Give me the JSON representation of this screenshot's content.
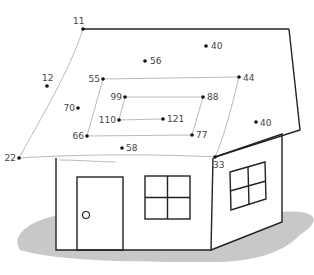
{
  "colors": {
    "line": "#222222",
    "guide": "#bbbbbb",
    "shadow": "#c8c8c8",
    "dot": "#111111",
    "label": "#444444",
    "background": "#ffffff"
  },
  "dots": [
    {
      "label": "11",
      "x": 83,
      "y": 29,
      "lx": 73,
      "ly": 24,
      "anchor": "start"
    },
    {
      "label": "56",
      "x": 145,
      "y": 61,
      "lx": 150,
      "ly": 64,
      "anchor": "start"
    },
    {
      "label": "40",
      "x": 206,
      "y": 46,
      "lx": 211,
      "ly": 49,
      "anchor": "start"
    },
    {
      "label": "12",
      "x": 47,
      "y": 86,
      "lx": 42,
      "ly": 81,
      "anchor": "start"
    },
    {
      "label": "55",
      "x": 103,
      "y": 79,
      "lx": 100,
      "ly": 82,
      "anchor": "end"
    },
    {
      "label": "44",
      "x": 239,
      "y": 77,
      "lx": 243,
      "ly": 81,
      "anchor": "start"
    },
    {
      "label": "70",
      "x": 78,
      "y": 108,
      "lx": 75,
      "ly": 111,
      "anchor": "end"
    },
    {
      "label": "99",
      "x": 125,
      "y": 97,
      "lx": 122,
      "ly": 100,
      "anchor": "end"
    },
    {
      "label": "88",
      "x": 203,
      "y": 97,
      "lx": 207,
      "ly": 100,
      "anchor": "start"
    },
    {
      "label": "110",
      "x": 119,
      "y": 120,
      "lx": 116,
      "ly": 123,
      "anchor": "end"
    },
    {
      "label": "121",
      "x": 163,
      "y": 119,
      "lx": 167,
      "ly": 122,
      "anchor": "start"
    },
    {
      "label": "40",
      "x": 256,
      "y": 122,
      "lx": 260,
      "ly": 126,
      "anchor": "start"
    },
    {
      "label": "66",
      "x": 87,
      "y": 136,
      "lx": 84,
      "ly": 139,
      "anchor": "end"
    },
    {
      "label": "77",
      "x": 192,
      "y": 135,
      "lx": 196,
      "ly": 138,
      "anchor": "start"
    },
    {
      "label": "22",
      "x": 19,
      "y": 158,
      "lx": 16,
      "ly": 161,
      "anchor": "end"
    },
    {
      "label": "58",
      "x": 122,
      "y": 148,
      "lx": 126,
      "ly": 151,
      "anchor": "start"
    },
    {
      "label": "33",
      "x": 215,
      "y": 157,
      "lx": 213,
      "ly": 168,
      "anchor": "start"
    }
  ],
  "guides": {
    "outer_roof_left": "M83,29 C70,70 40,120 19,158",
    "outer_roof_bottom": "M19,158 C80,154 160,154 215,157",
    "outer_roof_right": "M239,77 C232,105 225,135 215,157",
    "spiral_1": "M103,79 L239,77",
    "spiral_2": "M103,79 L87,136 L192,135 L203,97 L125,97 L119,120 L163,119",
    "stray_stroke": "M60,160 C80,160 100,162 115,162"
  },
  "house": {
    "roof_top": "M83,29 L289,29",
    "gable": "M289,29 L300,130 L215,157",
    "side_wall": "M215,157 L282,134 L282,222 L211,250",
    "front_wall": "M56,158 L56,250 L211,250 L213,158",
    "door": {
      "x": 77,
      "y": 177,
      "w": 46,
      "h": 73
    },
    "door_knob": {
      "cx": 86,
      "cy": 215,
      "r": 3.5
    },
    "front_window": {
      "x": 145,
      "y": 176,
      "w": 45,
      "h": 43
    },
    "side_window": "M230,172 L265,162 L266,199 L231,210 Z",
    "side_window_vertical": "M248,167 L249,205",
    "side_window_horizontal": "M230,191 L266,181",
    "shadow": "M20,250 C10,235 30,220 60,215 L60,250 L211,250 L282,222 L282,212 C305,210 330,215 300,235 C280,255 250,262 211,262 C140,262 60,262 20,250 Z"
  }
}
